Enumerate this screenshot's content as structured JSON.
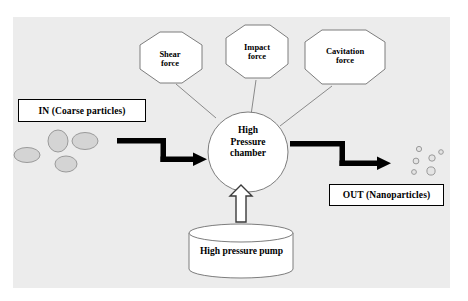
{
  "diagram": {
    "panel_color": "#ececec",
    "accent_color": "#000000",
    "particle_color": "#c9c9c9",
    "nodes": {
      "shear": {
        "label": "Shear\nforce",
        "shape": "octagon"
      },
      "impact": {
        "label": "Impact\nforce",
        "shape": "octagon"
      },
      "cavitation": {
        "label": "Cavitation\nforce",
        "shape": "octagon"
      },
      "chamber": {
        "label": "High\nPressure\nchamber",
        "shape": "circle"
      },
      "pump": {
        "label": "High pressure pump",
        "shape": "cylinder"
      }
    },
    "io": {
      "inlet_label": "IN (Coarse particles)",
      "outlet_label": "OUT (Nanoparticles)"
    },
    "coarse_particles": [
      {
        "cx": 27,
        "cy": 155,
        "rx": 13,
        "ry": 7.5
      },
      {
        "cx": 58,
        "cy": 141,
        "rx": 10,
        "ry": 11
      },
      {
        "cx": 85,
        "cy": 141,
        "rx": 13,
        "ry": 8.5
      },
      {
        "cx": 66,
        "cy": 164,
        "rx": 11,
        "ry": 8
      }
    ],
    "nano_particles": [
      {
        "cx": 419,
        "cy": 149,
        "r": 2.6
      },
      {
        "cx": 416,
        "cy": 161,
        "r": 2.9
      },
      {
        "cx": 432,
        "cy": 158,
        "r": 3.2
      },
      {
        "cx": 441,
        "cy": 152,
        "r": 2.3
      },
      {
        "cx": 414,
        "cy": 172,
        "r": 2.4
      },
      {
        "cx": 431,
        "cy": 171,
        "r": 4.1
      }
    ]
  }
}
